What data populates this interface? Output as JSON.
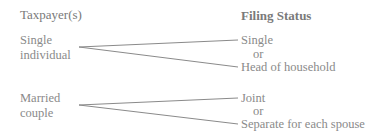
{
  "headers": {
    "left": "Taxpayer(s)",
    "right": "Filing Status"
  },
  "groups": [
    {
      "taxpayer_line1": "Single",
      "taxpayer_line2": "individual",
      "status_a": "Single",
      "connector": "or",
      "status_b": "Head of household"
    },
    {
      "taxpayer_line1": "Married",
      "taxpayer_line2": "couple",
      "status_a": "Joint",
      "connector": "or",
      "status_b": "Separate for each spouse"
    }
  ],
  "colors": {
    "text": "#8a8a8a",
    "line": "#8a8a8a",
    "background": "#ffffff"
  }
}
